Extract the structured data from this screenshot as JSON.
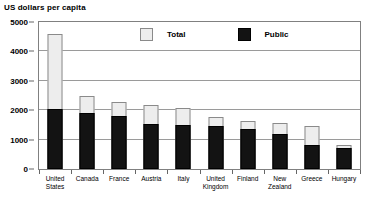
{
  "chart_data": {
    "type": "bar",
    "title": "US dollars per capita",
    "xlabel": "",
    "ylabel": "US dollars per capita",
    "ylim": [
      0,
      5000
    ],
    "yticks": [
      0,
      1000,
      2000,
      3000,
      4000,
      5000
    ],
    "ytick_labels": [
      "0",
      "1000",
      "2000",
      "3000",
      "4000",
      "5000"
    ],
    "grid": true,
    "stacked_overlay": true,
    "legend_position": "top-center",
    "categories": [
      "United States",
      "Canada",
      "France",
      "Austria",
      "Italy",
      "United Kingdom",
      "Finland",
      "New Zealand",
      "Greece",
      "Hungary"
    ],
    "category_lines": [
      [
        "United",
        "States"
      ],
      [
        "Canada"
      ],
      [
        "France"
      ],
      [
        "Austria"
      ],
      [
        "Italy"
      ],
      [
        "United",
        "Kingdom"
      ],
      [
        "Finland"
      ],
      [
        "New",
        "Zealand"
      ],
      [
        "Greece"
      ],
      [
        "Hungary"
      ]
    ],
    "series": [
      {
        "name": "Total",
        "color": "#ededed",
        "values": [
          4600,
          2500,
          2270,
          2170,
          2080,
          1760,
          1620,
          1550,
          1450,
          820
        ]
      },
      {
        "name": "Public",
        "color": "#131313",
        "values": [
          2050,
          1900,
          1790,
          1530,
          1500,
          1480,
          1350,
          1200,
          800,
          700
        ]
      }
    ]
  },
  "legend": {
    "entries": [
      {
        "label": "Total",
        "swatch": "total-swatch"
      },
      {
        "label": "Public",
        "swatch": "public-swatch"
      }
    ]
  },
  "colors": {
    "total_fill": "#ededed",
    "total_border": "#8a8a8a",
    "public_fill": "#131313",
    "frame": "#808080",
    "gridline": "#9a9a9a",
    "text": "#000000"
  }
}
